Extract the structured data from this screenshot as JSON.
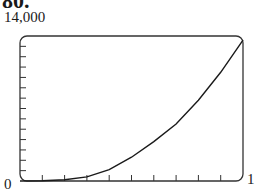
{
  "problem": {
    "number": "80."
  },
  "chart_data": {
    "type": "line",
    "title": "",
    "xlabel": "",
    "ylabel": "",
    "xlim": [
      0,
      1
    ],
    "ylim": [
      0,
      14000
    ],
    "x_tick_labels": [
      "0",
      "1"
    ],
    "y_tick_labels": [
      "0",
      "14,000"
    ],
    "x_minor_ticks": 9,
    "y_minor_ticks": 13,
    "grid": false,
    "series": [
      {
        "name": "curve",
        "x": [
          0,
          0.1,
          0.2,
          0.3,
          0.4,
          0.5,
          0.6,
          0.7,
          0.8,
          0.9,
          1.0
        ],
        "values": [
          0,
          15,
          120,
          400,
          1100,
          2300,
          3800,
          5500,
          7800,
          10500,
          13600
        ]
      }
    ]
  },
  "labels": {
    "ymax": "14,000",
    "ymin": "0",
    "xmax": "1"
  }
}
